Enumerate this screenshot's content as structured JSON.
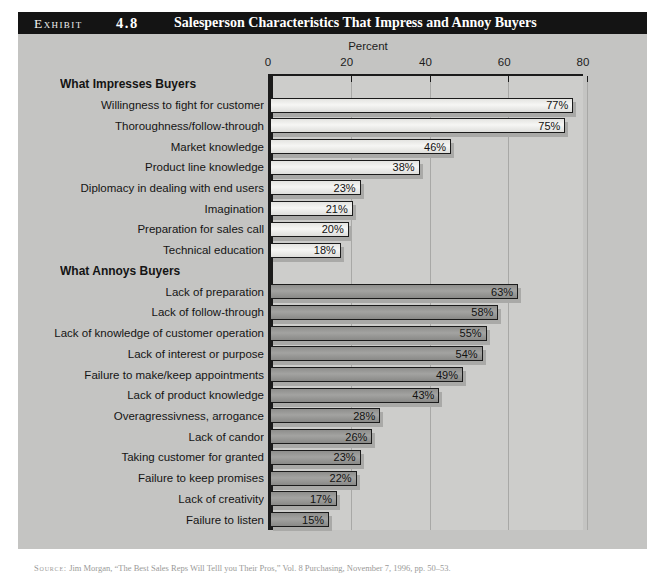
{
  "exhibit": {
    "kicker": "Exhibit",
    "number": "4.8",
    "title": "Salesperson Characteristics That Impress and Annoy Buyers"
  },
  "axis": {
    "title": "Percent",
    "ticks": [
      "0",
      "20",
      "40",
      "60",
      "80"
    ]
  },
  "groups": {
    "impress": "What Impresses Buyers",
    "annoy": "What Annoys Buyers"
  },
  "source": {
    "label": "Source:",
    "text": "Jim Morgan, “The Best Sales Reps Will Telll you Their Pros,” Vol. 8 Purchasing, November 7, 1996, pp. 50–53."
  },
  "colors": {
    "panel": "#c4c4c2",
    "plot": "#cdcdcb",
    "title_bar": "#141414",
    "bar_light": "#f0f0ee",
    "bar_dark": "#9b9b99",
    "bar_shadow": "#a9a9a7",
    "axis": "#1b1b1b"
  },
  "chart_data": {
    "type": "bar",
    "title": "Salesperson Characteristics That Impress and Annoy Buyers",
    "xlabel": "Percent",
    "ylabel": "",
    "xlim": [
      0,
      80
    ],
    "xticks": [
      0,
      20,
      40,
      60,
      80
    ],
    "grid": true,
    "orientation": "horizontal",
    "legend": "none",
    "value_suffix": "%",
    "groups": [
      {
        "name": "What Impresses Buyers",
        "style": "light",
        "categories": [
          "Willingness to fight for customer",
          "Thoroughness/follow-through",
          "Market knowledge",
          "Product line knowledge",
          "Diplomacy in dealing with end users",
          "Imagination",
          "Preparation for sales call",
          "Technical education"
        ],
        "values": [
          77,
          75,
          46,
          38,
          23,
          21,
          20,
          18
        ],
        "labels": [
          "77%",
          "75%",
          "46%",
          "38%",
          "23%",
          "21%",
          "20%",
          "18%"
        ]
      },
      {
        "name": "What Annoys Buyers",
        "style": "dark",
        "categories": [
          "Lack of preparation",
          "Lack of follow-through",
          "Lack of knowledge of customer operation",
          "Lack of interest or purpose",
          "Failure to make/keep appointments",
          "Lack of product knowledge",
          "Overagressivness, arrogance",
          "Lack of candor",
          "Taking customer for granted",
          "Failure to keep promises",
          "Lack of creativity",
          "Failure to listen"
        ],
        "values": [
          63,
          58,
          55,
          54,
          49,
          43,
          28,
          26,
          23,
          22,
          17,
          15
        ],
        "labels": [
          "63%",
          "58%",
          "55%",
          "54%",
          "49%",
          "43%",
          "28%",
          "26%",
          "23%",
          "22%",
          "17%",
          "15%"
        ]
      }
    ]
  }
}
